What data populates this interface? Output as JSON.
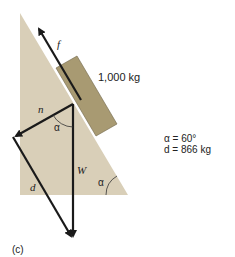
{
  "diagram": {
    "panel_label": "(c)",
    "block_mass_label": "1,000 kg",
    "vectors": {
      "friction": "f",
      "normal": "n",
      "weight": "W",
      "difference": "d"
    },
    "angle_label": "α",
    "given": {
      "alpha": "α = 60°",
      "d_value": "d = 866 kg"
    },
    "colors": {
      "incline": "#d9cfb8",
      "block": "#a89a72",
      "vector": "#1a1a1a"
    }
  }
}
